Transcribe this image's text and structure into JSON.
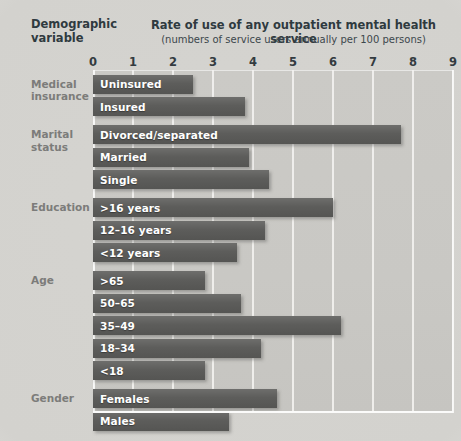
{
  "header": {
    "variable_title_line1": "Demographic",
    "variable_title_line2": "variable",
    "rate_title": "Rate of use of any outpatient mental health service",
    "rate_subtitle": "(numbers of service users annually per 100 persons)"
  },
  "colors": {
    "bar": "#5d5d5b",
    "plot_background": "#c9c8c4",
    "page_background": "#d4d3cf",
    "gridline": "#f3f2f0",
    "bar_label_text": "#ffffff",
    "group_label_text": "#7c7c7a",
    "heading_text": "#2f3a3f"
  },
  "chart_data": {
    "type": "bar",
    "orientation": "horizontal",
    "title": "Rate of use of any outpatient mental health service",
    "subtitle": "(numbers of service users annually per 100 persons)",
    "xlabel": "numbers of service users annually per 100 persons",
    "ylabel": "Demographic variable",
    "xlim": [
      0,
      9
    ],
    "xticks": [
      0,
      1,
      2,
      3,
      4,
      5,
      6,
      7,
      8,
      9
    ],
    "xtick_labels": [
      "0",
      "1",
      "2",
      "3",
      "4",
      "5",
      "6",
      "7",
      "8",
      "9"
    ],
    "grid": true,
    "legend": "none",
    "categories": [
      "Uninsured",
      "Insured",
      "Divorced/separated",
      "Married",
      "Single",
      ">16 years",
      "12–16 years",
      "<12 years",
      ">65",
      "50–65",
      "35–49",
      "18–34",
      "<18",
      "Females",
      "Males"
    ],
    "values": [
      2.5,
      3.8,
      7.7,
      3.9,
      4.4,
      6.0,
      4.3,
      3.6,
      2.8,
      3.7,
      6.2,
      4.2,
      2.8,
      4.6,
      3.4
    ],
    "groups": [
      {
        "label": "Medical insurance",
        "label_line1": "Medical",
        "label_line2": "insurance",
        "bars": [
          {
            "category": "Uninsured",
            "value": 2.5
          },
          {
            "category": "Insured",
            "value": 3.8
          }
        ]
      },
      {
        "label": "Marital status",
        "label_line1": "Marital",
        "label_line2": "status",
        "bars": [
          {
            "category": "Divorced/separated",
            "value": 7.7
          },
          {
            "category": "Married",
            "value": 3.9
          },
          {
            "category": "Single",
            "value": 4.4
          }
        ]
      },
      {
        "label": "Education",
        "label_line1": "Education",
        "label_line2": "",
        "bars": [
          {
            "category": ">16 years",
            "value": 6.0
          },
          {
            "category": "12–16 years",
            "value": 4.3
          },
          {
            "category": "<12 years",
            "value": 3.6
          }
        ]
      },
      {
        "label": "Age",
        "label_line1": "Age",
        "label_line2": "",
        "bars": [
          {
            "category": ">65",
            "value": 2.8
          },
          {
            "category": "50–65",
            "value": 3.7
          },
          {
            "category": "35–49",
            "value": 6.2
          },
          {
            "category": "18–34",
            "value": 4.2
          },
          {
            "category": "<18",
            "value": 2.8
          }
        ]
      },
      {
        "label": "Gender",
        "label_line1": "Gender",
        "label_line2": "",
        "bars": [
          {
            "category": "Females",
            "value": 4.6
          },
          {
            "category": "Males",
            "value": 3.4
          }
        ]
      }
    ]
  }
}
